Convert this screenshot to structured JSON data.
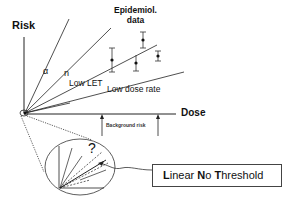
{
  "diagram": {
    "axes": {
      "y_label": "Risk",
      "x_label": "Dose"
    },
    "epidemiological_data_label": [
      "Epidemiol.",
      "data"
    ],
    "curve_labels": {
      "alpha": "α",
      "neutron": "n",
      "low_let": "Low LET",
      "low_dose_rate": "Low dose rate"
    },
    "background_risk_label": "Background risk",
    "inset": {
      "question_mark": "?"
    },
    "lnt_box": {
      "parts": [
        {
          "text": "L",
          "bold": true
        },
        {
          "text": "inear ",
          "bold": false
        },
        {
          "text": "N",
          "bold": true
        },
        {
          "text": "o ",
          "bold": false
        },
        {
          "text": "T",
          "bold": true
        },
        {
          "text": "hreshold",
          "bold": false
        }
      ]
    },
    "data_points": [
      {
        "x": 112,
        "y": 60,
        "err_low": 72,
        "err_high": 48
      },
      {
        "x": 142,
        "y": 40,
        "err_low": 48,
        "err_high": 32
      },
      {
        "x": 136,
        "y": 63,
        "err_low": 71,
        "err_high": 55
      },
      {
        "x": 158,
        "y": 56,
        "err_low": 61,
        "err_high": 51
      }
    ],
    "colors": {
      "line": "#222222",
      "background": "#ffffff"
    }
  }
}
